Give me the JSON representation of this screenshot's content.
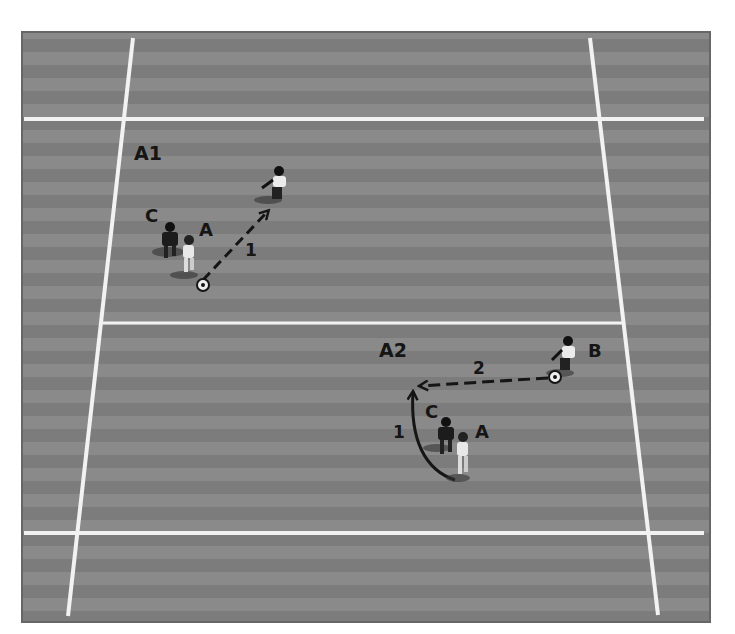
{
  "diagram": {
    "type": "soccer-drill",
    "colors": {
      "background": "#ffffff",
      "pitch": "#868686",
      "stripe_dark": "#7a7a7a",
      "line": "#f2f2f2",
      "ink": "#151515"
    },
    "zones": {
      "top": {
        "label": "A1"
      },
      "bottom": {
        "label": "A2"
      }
    },
    "top_drill": {
      "players": [
        {
          "id": "C",
          "label": "C",
          "kit": "dark"
        },
        {
          "id": "A",
          "label": "A",
          "kit": "light"
        },
        {
          "id": "receiver",
          "label": "",
          "kit": "light"
        }
      ],
      "moves": [
        {
          "step": "1",
          "kind": "pass",
          "style": "dashed",
          "from": "A",
          "to": "receiver"
        }
      ]
    },
    "bottom_drill": {
      "players": [
        {
          "id": "C",
          "label": "C",
          "kit": "dark"
        },
        {
          "id": "A",
          "label": "A",
          "kit": "light"
        },
        {
          "id": "B",
          "label": "B",
          "kit": "light"
        }
      ],
      "moves": [
        {
          "step": "1",
          "kind": "run",
          "style": "solid-curve",
          "from": "A",
          "to": "space"
        },
        {
          "step": "2",
          "kind": "pass",
          "style": "dashed",
          "from": "B",
          "to": "space"
        }
      ]
    }
  }
}
